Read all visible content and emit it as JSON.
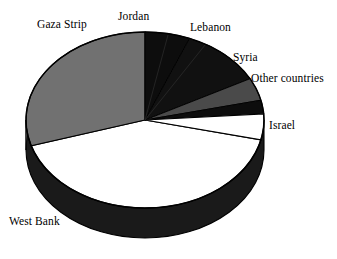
{
  "chart_data": {
    "type": "pie",
    "title": "",
    "subtitle": "",
    "xlabel": "",
    "ylabel": "",
    "legend_position": "none",
    "grid": false,
    "three_d": true,
    "start_angle_deg": 0,
    "direction": "clockwise",
    "categories": [
      "Jordan",
      "Lebanon",
      "Syria",
      "Other countries",
      "Israel",
      "West Bank",
      "Gaza Strip"
    ],
    "values": [
      6.1,
      11.1,
      4.2,
      2.5,
      4.7,
      41.7,
      29.7
    ],
    "colors": [
      "#0d0d0d",
      "#111111",
      "#4a4a4a",
      "#0d0d0d",
      "#ffffff",
      "#ffffff",
      "#717171"
    ],
    "slices": [
      {
        "label": "Jordan",
        "value": 6.1,
        "start_deg": 0,
        "end_deg": 22,
        "color": "#0d0d0d"
      },
      {
        "label": "Lebanon",
        "value": 11.1,
        "start_deg": 22,
        "end_deg": 62,
        "color": "#111111"
      },
      {
        "label": "Syria",
        "value": 4.2,
        "start_deg": 62,
        "end_deg": 77,
        "color": "#4a4a4a"
      },
      {
        "label": "Other countries",
        "value": 2.5,
        "start_deg": 77,
        "end_deg": 86,
        "color": "#0d0d0d"
      },
      {
        "label": "Israel",
        "value": 4.7,
        "start_deg": 86,
        "end_deg": 103,
        "color": "#ffffff"
      },
      {
        "label": "West Bank",
        "value": 41.7,
        "start_deg": 103,
        "end_deg": 253,
        "color": "#ffffff"
      },
      {
        "label": "Gaza Strip",
        "value": 29.7,
        "start_deg": 253,
        "end_deg": 360,
        "color": "#717171"
      }
    ]
  },
  "labels": {
    "jordan": "Jordan",
    "gaza_strip": "Gaza Strip",
    "lebanon": "Lebanon",
    "syria": "Syria",
    "other_countries": "Other countries",
    "israel": "Israel",
    "west_bank": "West Bank"
  },
  "style": {
    "outline_color": "#000000",
    "background": "#ffffff",
    "side_dark": "#1a1a1a",
    "side_gray": "#5e5e5e"
  }
}
